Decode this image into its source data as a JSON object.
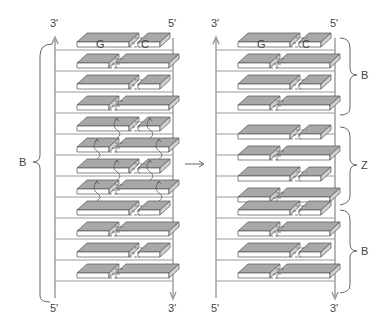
{
  "figure": {
    "left_ladder": {
      "top_labels": {
        "left": "3′",
        "right": "5′"
      },
      "bottom_labels": {
        "left": "5′",
        "right": "3′"
      },
      "region_label": "B",
      "base_labels": {
        "first_left": "G",
        "first_right": "C"
      },
      "flipped_rows": [
        4,
        5,
        6,
        7
      ]
    },
    "arrow": {
      "direction": "right"
    },
    "right_ladder": {
      "top_labels": {
        "left": "3′",
        "right": "5′"
      },
      "bottom_labels": {
        "left": "5′",
        "right": "3′"
      },
      "base_labels": {
        "first_left": "G",
        "first_right": "C"
      },
      "regions": [
        {
          "label": "B",
          "rows": "1-4"
        },
        {
          "label": "Z",
          "rows": "5-8"
        },
        {
          "label": "B",
          "rows": "9-12"
        }
      ]
    },
    "rows_count": 12,
    "colors": {
      "block_top": "#a8a8a8",
      "block_front": "#ffffff",
      "rail": "#9a9a9a",
      "text": "#444444"
    }
  }
}
